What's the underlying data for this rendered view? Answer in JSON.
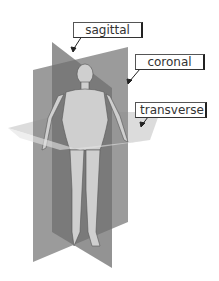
{
  "diagram": {
    "labels": [
      {
        "id": "sagittal",
        "text": "sagittal"
      },
      {
        "id": "coronal",
        "text": "coronal"
      },
      {
        "id": "transverse",
        "text": "transverse"
      }
    ],
    "colors": {
      "sagittal_plane": "#7a7a7a",
      "coronal_plane": "#8f8f8f",
      "transverse_plane": "#d4d4d4",
      "body": "#c8c8c8",
      "label_border": "#333333",
      "label_text": "#333333"
    }
  }
}
